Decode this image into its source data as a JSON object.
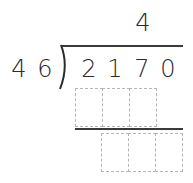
{
  "problem": {
    "type": "long-division",
    "divisor": [
      "4",
      "6"
    ],
    "dividend": [
      "2",
      "1",
      "7",
      "0"
    ],
    "quotient": [
      "4"
    ]
  },
  "work_rows": [
    {
      "name": "product-row",
      "cells": [
        "",
        "",
        ""
      ]
    },
    {
      "name": "remainder-row",
      "cells": [
        "",
        "",
        ""
      ]
    }
  ],
  "colors": {
    "ink": "#2a2a2a",
    "rule": "#3a3a3a",
    "box_border": "#b5b5b5"
  }
}
